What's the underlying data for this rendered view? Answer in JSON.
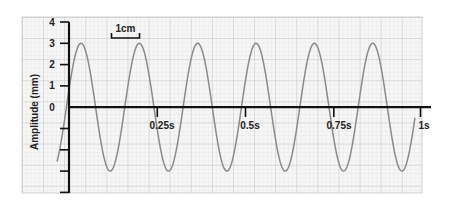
{
  "chart_data": {
    "type": "line",
    "title": "",
    "xlabel": "",
    "ylabel": "Amplitude (mm)",
    "x_tick_labels": [
      "0.25s",
      "0.5s",
      "0.75s",
      "1s"
    ],
    "x_ticks": [
      0.25,
      0.5,
      0.75,
      1.0
    ],
    "y_tick_labels": [
      "4",
      "3",
      "2",
      "1",
      "0"
    ],
    "y_ticks": [
      4,
      3,
      2,
      1,
      0,
      -1,
      -2,
      -3,
      -4
    ],
    "xlim": [
      -0.034,
      1.03
    ],
    "ylim": [
      -4,
      4
    ],
    "grid": true,
    "legend": null,
    "annotations": [
      {
        "text": "1cm",
        "type": "scale-bar"
      }
    ],
    "series": [
      {
        "name": "waveform",
        "model": "3*sin(2*pi*6.05*(t+0.0073))",
        "amplitude_mm": 3,
        "frequency_hz": 6,
        "peaks_t": [
          0.034,
          0.201,
          0.368,
          0.535,
          0.7,
          0.861
        ],
        "troughs_t": [
          0.122,
          0.295,
          0.459,
          0.623,
          0.788,
          0.949
        ],
        "t_start": -0.034,
        "t_end": 0.98,
        "color": "#8a8a8a"
      }
    ]
  },
  "colors": {
    "grid_minor": "#dedede",
    "grid_major": "#c4c4c4",
    "axis": "#111111",
    "wave": "#8a8a8a"
  },
  "scale_bar": {
    "label": "1cm"
  },
  "labels": {
    "y_axis_title": "Amplitude (mm)",
    "y4": "4",
    "y3": "3",
    "y2": "2",
    "y1": "1",
    "y0": "0",
    "x1": "0.25s",
    "x2": "0.5s",
    "x3": "0.75s",
    "x4": "1s"
  }
}
